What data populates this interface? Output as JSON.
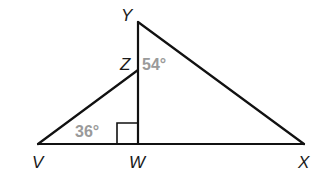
{
  "diagram": {
    "type": "geometry-triangles",
    "points": {
      "Y": {
        "label": "Y",
        "x": 138,
        "y": 22
      },
      "Z": {
        "label": "Z",
        "x": 138,
        "y": 70
      },
      "W": {
        "label": "W",
        "x": 138,
        "y": 144
      },
      "V": {
        "label": "V",
        "x": 38,
        "y": 144
      },
      "X": {
        "label": "X",
        "x": 304,
        "y": 144
      }
    },
    "segments": [
      "VX",
      "YW",
      "VZ",
      "YX"
    ],
    "angles": {
      "angle_YZ": {
        "label": "54°",
        "vertex": "Y"
      },
      "angle_V": {
        "label": "36°",
        "vertex": "V"
      },
      "right_angle_W": {
        "vertex": "W",
        "marker": "square"
      }
    },
    "colors": {
      "line": "#111111",
      "angle_label": "#9a9a9a",
      "point_label": "#1a1a1a"
    }
  }
}
